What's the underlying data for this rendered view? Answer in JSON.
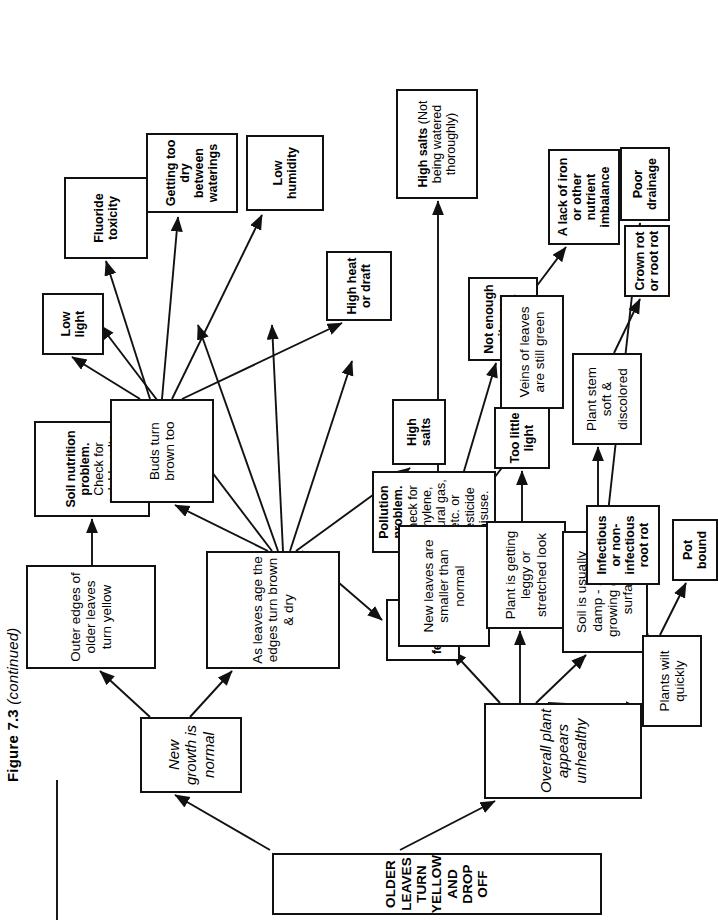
{
  "figure": {
    "caption_label": "Figure 7.3",
    "caption_note": "(continued)",
    "page_number": ""
  },
  "chart_data": {
    "type": "diagram",
    "title": "OLDER LEAVES TURN YELLOW AND DROP OFF",
    "orientation": "rotated-90-ccw",
    "nodes": [
      {
        "id": "root",
        "label": "OLDER LEAVES TURN YELLOW AND DROP OFF",
        "style": "title"
      },
      {
        "id": "newgrowth",
        "label": "New growth is normal",
        "style": "italic"
      },
      {
        "id": "unhealthy",
        "label": "Overall plant appears unhealthy",
        "style": "italic"
      },
      {
        "id": "outeredges",
        "label": "Outer edges of older leaves turn yellow",
        "style": "regular"
      },
      {
        "id": "soilnutr",
        "label": "Soil nutrition problem. Check for soluble salts",
        "style": "mixed",
        "bold_prefix": "Soil nutrition problem."
      },
      {
        "id": "leavesage",
        "label": "As leaves age the edges turn brown & dry",
        "style": "regular"
      },
      {
        "id": "budsbrown",
        "label": "Buds turn brown too",
        "style": "regular"
      },
      {
        "id": "lowlight",
        "label": "Low light",
        "style": "bold"
      },
      {
        "id": "fluoride",
        "label": "Fluoride toxicity",
        "style": "bold"
      },
      {
        "id": "toodry",
        "label": "Getting too dry between waterings",
        "style": "bold"
      },
      {
        "id": "lowhumid",
        "label": "Low humidity",
        "style": "bold"
      },
      {
        "id": "highheat",
        "label": "High heat or draft",
        "style": "bold"
      },
      {
        "id": "highsalts",
        "label": "High salts",
        "style": "bold"
      },
      {
        "id": "pollution",
        "label": "Pollution problem. Check for ethylene, natural gas, etc. or pesticide misuse.",
        "style": "mixed",
        "bold_prefix": "Pollution problem."
      },
      {
        "id": "toomuchfert",
        "label": "Too much fertilizer",
        "style": "bold"
      },
      {
        "id": "newsmaller",
        "label": "New leaves are smaller than normal",
        "style": "regular"
      },
      {
        "id": "leggy",
        "label": "Plant is getting leggy or stretched look",
        "style": "regular"
      },
      {
        "id": "soildamp",
        "label": "Soil is usually damp - algae growing on soil surface",
        "style": "regular"
      },
      {
        "id": "wilt",
        "label": "Plants wilt quickly",
        "style": "regular"
      },
      {
        "id": "highsalts2",
        "label": "High salts (Not being watered thoroughly)",
        "style": "mixed",
        "bold_prefix": "High salts"
      },
      {
        "id": "toolittle",
        "label": "Too little light",
        "style": "bold"
      },
      {
        "id": "notenoughN",
        "label": "Not enough nitrogen fertilizer",
        "style": "bold"
      },
      {
        "id": "veins",
        "label": "Veins of leaves are still green",
        "style": "regular"
      },
      {
        "id": "ironlack",
        "label": "A lack of iron or other nutrient imbalance",
        "style": "bold"
      },
      {
        "id": "stemsoft",
        "label": "Plant stem soft & discolored",
        "style": "regular"
      },
      {
        "id": "crownrot",
        "label": "Crown rot or root rot",
        "style": "bold"
      },
      {
        "id": "rootrot",
        "label": "Infectious or non-infectious root rot",
        "style": "bold"
      },
      {
        "id": "potbound",
        "label": "Pot bound",
        "style": "bold"
      },
      {
        "id": "poordrain",
        "label": "Poor drainage",
        "style": "bold"
      }
    ],
    "edges": [
      [
        "root",
        "newgrowth"
      ],
      [
        "root",
        "unhealthy"
      ],
      [
        "newgrowth",
        "outeredges"
      ],
      [
        "newgrowth",
        "leavesage"
      ],
      [
        "outeredges",
        "soilnutr"
      ],
      [
        "leavesage",
        "budsbrown"
      ],
      [
        "leavesage",
        "toodry"
      ],
      [
        "leavesage",
        "lowhumid"
      ],
      [
        "leavesage",
        "highheat"
      ],
      [
        "leavesage",
        "highsalts"
      ],
      [
        "leavesage",
        "pollution"
      ],
      [
        "leavesage",
        "toomuchfert"
      ],
      [
        "budsbrown",
        "lowlight"
      ],
      [
        "budsbrown",
        "fluoride"
      ],
      [
        "budsbrown",
        "toodry"
      ],
      [
        "budsbrown",
        "lowhumid"
      ],
      [
        "budsbrown",
        "highheat"
      ],
      [
        "unhealthy",
        "newsmaller"
      ],
      [
        "unhealthy",
        "leggy"
      ],
      [
        "unhealthy",
        "soildamp"
      ],
      [
        "unhealthy",
        "wilt"
      ],
      [
        "newsmaller",
        "highsalts2"
      ],
      [
        "newsmaller",
        "notenoughN"
      ],
      [
        "newsmaller",
        "veins"
      ],
      [
        "leggy",
        "toolittle"
      ],
      [
        "veins",
        "ironlack"
      ],
      [
        "soildamp",
        "stemsoft"
      ],
      [
        "soildamp",
        "poordrain"
      ],
      [
        "stemsoft",
        "crownrot"
      ],
      [
        "wilt",
        "rootrot"
      ],
      [
        "wilt",
        "potbound"
      ]
    ]
  }
}
